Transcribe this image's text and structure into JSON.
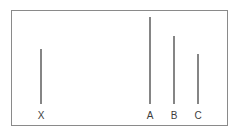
{
  "figure": {
    "background_color": "#ffffff",
    "frame": {
      "border_color": "#8a8a8a",
      "fill_color": "#ffffff",
      "x": 11,
      "y": 10,
      "width": 217,
      "height": 116
    },
    "line_color": "#858585",
    "label_color": "#3d3d3d"
  },
  "chart_data": {
    "type": "bar",
    "xlabel": "",
    "ylabel": "",
    "grid": false,
    "legend": null,
    "orientation": "vertical",
    "note": "Four vertical line segments of differing lengths, each labeled beneath. All segments share a common baseline at the bottom of the frame.",
    "categories": [
      "X",
      "A",
      "B",
      "C"
    ],
    "values": [
      55,
      87,
      68,
      50
    ],
    "units": "px",
    "baseline_y": 103,
    "bars": [
      {
        "label": "X",
        "center_x": 40,
        "top_y": 48,
        "bottom_y": 103,
        "length": 55,
        "label_x": 33,
        "label_y": 110
      },
      {
        "label": "A",
        "center_x": 149,
        "top_y": 16,
        "bottom_y": 103,
        "length": 87,
        "label_x": 142,
        "label_y": 110
      },
      {
        "label": "B",
        "center_x": 173,
        "top_y": 35,
        "bottom_y": 103,
        "length": 68,
        "label_x": 166,
        "label_y": 110
      },
      {
        "label": "C",
        "center_x": 197,
        "top_y": 53,
        "bottom_y": 103,
        "length": 50,
        "label_x": 190,
        "label_y": 110
      }
    ]
  }
}
